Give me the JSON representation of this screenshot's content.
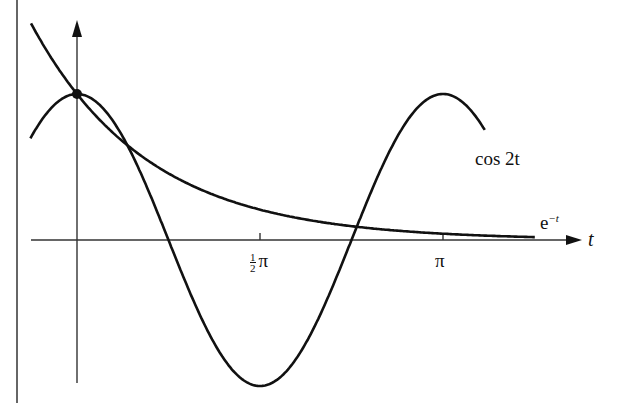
{
  "figure": {
    "curves": [
      {
        "name": "cosine",
        "label": "cos 2t",
        "expression": "cos 2t"
      },
      {
        "name": "exponential",
        "label_base": "e",
        "label_exp": "−t",
        "expression": "e^{-t}"
      }
    ],
    "x_axis": {
      "label": "t",
      "ticks": [
        {
          "value": "π/2",
          "label_num": "1",
          "label_den": "2",
          "label_sym": "π"
        },
        {
          "value": "π",
          "label": "π"
        }
      ]
    },
    "highlight_point": {
      "t": 0,
      "y": 1,
      "note": "intersection at (0,1)"
    }
  },
  "chart_data": {
    "type": "line",
    "title": "",
    "xlabel": "t",
    "ylabel": "",
    "xlim": [
      -0.4,
      4.3
    ],
    "ylim": [
      -1,
      1.5
    ],
    "grid": false,
    "x_ticks": [
      "½π",
      "π"
    ],
    "series": [
      {
        "name": "cos 2t",
        "x": [
          -0.4,
          0,
          0.3927,
          0.7854,
          1.1781,
          1.5708,
          1.9635,
          2.3562,
          2.7489,
          3.1416,
          3.5
        ],
        "values": [
          0.697,
          1,
          0.707,
          0,
          -0.707,
          -1,
          -0.707,
          0,
          0.707,
          1,
          0.754
        ]
      },
      {
        "name": "e^−t",
        "x": [
          -0.4,
          0,
          0.5,
          1,
          1.5,
          2,
          2.5,
          3,
          3.5,
          4,
          4.3
        ],
        "values": [
          1.492,
          1,
          0.607,
          0.368,
          0.223,
          0.135,
          0.082,
          0.05,
          0.03,
          0.018,
          0.014
        ]
      }
    ],
    "annotations": [
      "cos 2t",
      "e^−t",
      "point at (0,1)"
    ]
  }
}
